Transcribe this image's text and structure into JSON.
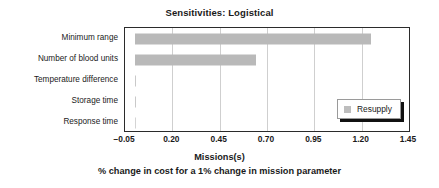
{
  "chart_data": {
    "type": "bar",
    "orientation": "horizontal",
    "title": "Sensitivities: Logistical",
    "xlabel": "Missions(s)",
    "xlabel_sub": "% change in cost for a 1% change in mission parameter",
    "ylabel": "",
    "categories": [
      "Minimum range",
      "Number of blood units",
      "Temperature difference",
      "Storage time",
      "Response time"
    ],
    "series": [
      {
        "name": "Resupply",
        "color": "#b9b9b9",
        "values": [
          1.25,
          0.64,
          0.005,
          0.005,
          0.0
        ]
      }
    ],
    "xlim": [
      -0.05,
      1.45
    ],
    "xticks": [
      -0.05,
      0.2,
      0.45,
      0.7,
      0.95,
      1.2,
      1.45
    ],
    "xticklabels": [
      "−0.05",
      "0.20",
      "0.45",
      "0.70",
      "0.95",
      "1.20",
      "1.45"
    ],
    "grid": "vertical",
    "legend": {
      "position": "lower-right",
      "entries": [
        {
          "label": "Resupply",
          "swatch_color": "#bdbdbd"
        }
      ]
    }
  }
}
